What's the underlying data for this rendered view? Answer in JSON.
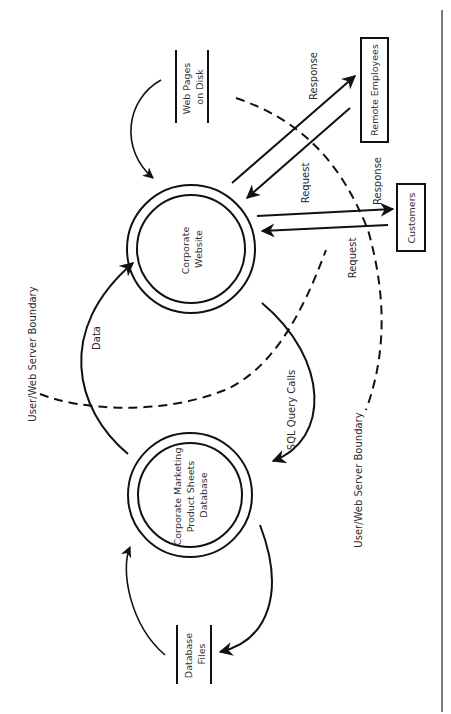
{
  "diagram": {
    "type": "data-flow-diagram",
    "orientation": "rotated-90-ccw",
    "processes": [
      {
        "id": "corporate-website",
        "label_lines": [
          "Corporate",
          "Website"
        ]
      },
      {
        "id": "marketing-db",
        "label_lines": [
          "Corporate Marketing",
          "Product Sheets",
          "Database"
        ]
      }
    ],
    "data_stores": [
      {
        "id": "web-pages",
        "label_lines": [
          "Web Pages",
          "on Disk"
        ]
      },
      {
        "id": "db-files",
        "label_lines": [
          "Database",
          "Files"
        ]
      }
    ],
    "external_entities": [
      {
        "id": "remote-employees",
        "label": "Remote Employees"
      },
      {
        "id": "customers",
        "label": "Customers"
      }
    ],
    "flows": [
      {
        "from": "remote-employees",
        "to": "corporate-website",
        "label": "Request"
      },
      {
        "from": "corporate-website",
        "to": "remote-employees",
        "label": "Response"
      },
      {
        "from": "customers",
        "to": "corporate-website",
        "label": "Request"
      },
      {
        "from": "corporate-website",
        "to": "customers",
        "label": "Response"
      },
      {
        "from": "corporate-website",
        "to": "marketing-db",
        "label": "SQL Query Calls"
      },
      {
        "from": "marketing-db",
        "to": "corporate-website",
        "label": "Data"
      },
      {
        "from": "web-pages",
        "to": "corporate-website",
        "label": ""
      },
      {
        "from": "db-files",
        "to": "marketing-db",
        "label": ""
      },
      {
        "from": "marketing-db",
        "to": "db-files",
        "label": ""
      }
    ],
    "flow_labels": {
      "remote_response": "Response",
      "remote_request": "Request",
      "customer_response": "Response",
      "customer_request": "Request",
      "sql_query_calls": "SQL Query Calls",
      "data": "Data"
    },
    "boundaries": [
      {
        "id": "boundary-left",
        "label": "User/Web Server Boundary"
      },
      {
        "id": "boundary-right",
        "label": "User/Web Server Boundary"
      }
    ]
  }
}
